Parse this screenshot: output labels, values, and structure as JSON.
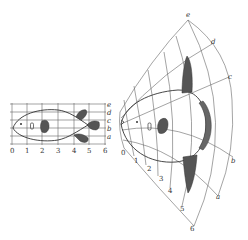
{
  "figure": {
    "left_panel": {
      "column_labels": [
        "0",
        "1",
        "2",
        "3",
        "4",
        "5",
        "6"
      ],
      "row_labels": [
        "e",
        "d",
        "c",
        "b",
        "a"
      ]
    },
    "right_panel": {
      "radial_labels": [
        "0",
        "1",
        "2",
        "3",
        "4",
        "5",
        "6"
      ],
      "arc_labels": [
        "e",
        "d",
        "c",
        "b",
        "a"
      ]
    },
    "colors": {
      "line": "#555555",
      "fin_fill": "#555555",
      "background": "#ffffff"
    }
  }
}
